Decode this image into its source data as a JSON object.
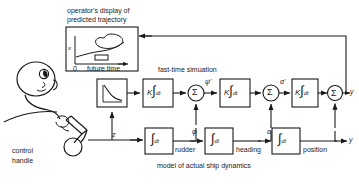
{
  "diagram": {
    "display_panel": {
      "caption_line1": "operator's display of",
      "caption_line2": "predicted trajectory",
      "y_axis_label": "x",
      "origin_label": "0",
      "x_axis_label": "future time"
    },
    "operator": {
      "handle_label_line1": "control",
      "handle_label_line2": "handle"
    },
    "captions": {
      "fast_time": "fast-time simuation",
      "ship_model": "model of actual ship dynamics"
    },
    "signals": {
      "handle_output": "z",
      "psi_prime": "ψ'",
      "alpha_prime": "α'",
      "phi": "φ",
      "alpha": "α",
      "rudder": "rudder",
      "heading": "heading",
      "position": "position",
      "output": "y",
      "output_lower": "y"
    },
    "blocks": {
      "shaper": {
        "name": "decay-curve-block",
        "glyph": "exponential-decay-curve"
      },
      "gain_int_1": {
        "k": "K",
        "integral": "∫",
        "dt": "dt"
      },
      "gain_int_2": {
        "k": "K",
        "integral": "∫",
        "dt": "dt"
      },
      "gain_int_3": {
        "k": "K",
        "integral": "∫",
        "dt": "dt"
      },
      "int_rudder": {
        "integral": "∫",
        "dt": "dt"
      },
      "int_heading": {
        "integral": "∫",
        "dt": "dt"
      },
      "int_position": {
        "integral": "∫",
        "dt": "dt"
      },
      "sum_symbol": "Σ"
    },
    "colors": {
      "stroke": "#1a1a1a",
      "background": "#ffffff",
      "text": "#1a1a1a"
    }
  }
}
